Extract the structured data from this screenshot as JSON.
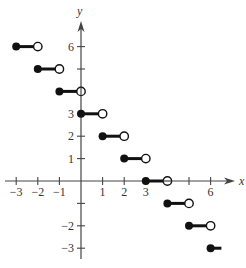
{
  "chart_data": {
    "type": "line",
    "subtype": "step",
    "title": "",
    "xlabel": "x",
    "ylabel": "y",
    "xlim": [
      -3.5,
      7
    ],
    "ylim": [
      -3.5,
      7.5
    ],
    "grid": false,
    "x_ticks": [
      -3,
      -2,
      -1,
      1,
      2,
      3,
      4,
      5,
      6
    ],
    "x_tick_labels": [
      "−3",
      "−2",
      "−1",
      "1",
      "2",
      "3",
      "",
      "",
      "6"
    ],
    "y_ticks": [
      6,
      5,
      4,
      3,
      2,
      1,
      -1,
      -2,
      -3
    ],
    "y_tick_labels": [
      "6",
      "",
      "",
      "3",
      "2",
      "1",
      "",
      "−2",
      "−3"
    ],
    "segments": [
      {
        "x_start": -3,
        "x_end": -2,
        "y": 6,
        "start_closed": true,
        "end_open": true
      },
      {
        "x_start": -2,
        "x_end": -1,
        "y": 5,
        "start_closed": true,
        "end_open": true
      },
      {
        "x_start": -1,
        "x_end": 0,
        "y": 4,
        "start_closed": true,
        "end_open": true
      },
      {
        "x_start": 0,
        "x_end": 1,
        "y": 3,
        "start_closed": true,
        "end_open": true
      },
      {
        "x_start": 1,
        "x_end": 2,
        "y": 2,
        "start_closed": true,
        "end_open": true
      },
      {
        "x_start": 2,
        "x_end": 3,
        "y": 1,
        "start_closed": true,
        "end_open": true
      },
      {
        "x_start": 3,
        "x_end": 4,
        "y": 0,
        "start_closed": true,
        "end_open": true
      },
      {
        "x_start": 4,
        "x_end": 5,
        "y": -1,
        "start_closed": true,
        "end_open": true
      },
      {
        "x_start": 5,
        "x_end": 6,
        "y": -2,
        "start_closed": true,
        "end_open": true
      },
      {
        "x_start": 6,
        "x_end": 6.5,
        "y": -3,
        "start_closed": true,
        "end_open": false
      }
    ]
  },
  "axes": {
    "x_label": "x",
    "y_label": "y"
  },
  "layout": {
    "origin_px": [
      81,
      181
    ],
    "unit_x_px": 21.6,
    "unit_y_px": 22.4
  }
}
